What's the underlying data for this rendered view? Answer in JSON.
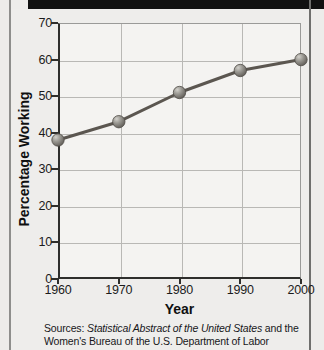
{
  "page": {
    "background_color": "#edecea",
    "top_bar_color": "#111111"
  },
  "chart_data": {
    "type": "line",
    "title": "",
    "xlabel": "Year",
    "ylabel": "Percentage Working",
    "categories": [
      "1960",
      "1970",
      "1980",
      "1990",
      "2000"
    ],
    "x": [
      1960,
      1970,
      1980,
      1990,
      2000
    ],
    "values": [
      38,
      43,
      51,
      57,
      60
    ],
    "series": [
      {
        "name": "Percentage Working",
        "values": [
          38,
          43,
          51,
          57,
          60
        ]
      }
    ],
    "xlim": [
      1960,
      2000
    ],
    "ylim": [
      0,
      70
    ],
    "ytick_labels": [
      "0",
      "10",
      "20",
      "30",
      "40",
      "50",
      "60",
      "70"
    ],
    "ytick_values": [
      0,
      10,
      20,
      30,
      40,
      50,
      60,
      70
    ],
    "xtick_labels": [
      "1960",
      "1970",
      "1980",
      "1990",
      "2000"
    ],
    "grid": true,
    "legend": "none",
    "line_color": "#5b5650",
    "marker_color": "#8d8b86",
    "marker_shape": "sphere"
  },
  "source_note": {
    "prefix": "Sources:",
    "italic_title": "Statistical Abstract of the United States",
    "middle": " and the",
    "line2": "Women's Bureau of the U.S. Department of Labor"
  }
}
